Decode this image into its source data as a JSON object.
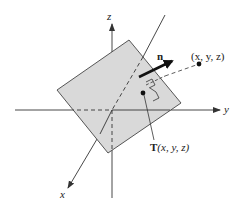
{
  "diagram": {
    "type": "3d-plane-with-normal-vector",
    "colors": {
      "background": "#ffffff",
      "plane_fill": "#d9d9d9",
      "plane_stroke": "#444444",
      "axis": "#333333",
      "vector": "#111111",
      "text": "#222222"
    },
    "axes": {
      "z_label": "z",
      "y_label": "y",
      "x_label": "x"
    },
    "normal_vector": {
      "label": "n"
    },
    "points": {
      "external_point_label": "(x, y, z)",
      "projection_point_label_prefix": "T",
      "projection_point_label_args": "(x, y, z)"
    }
  }
}
